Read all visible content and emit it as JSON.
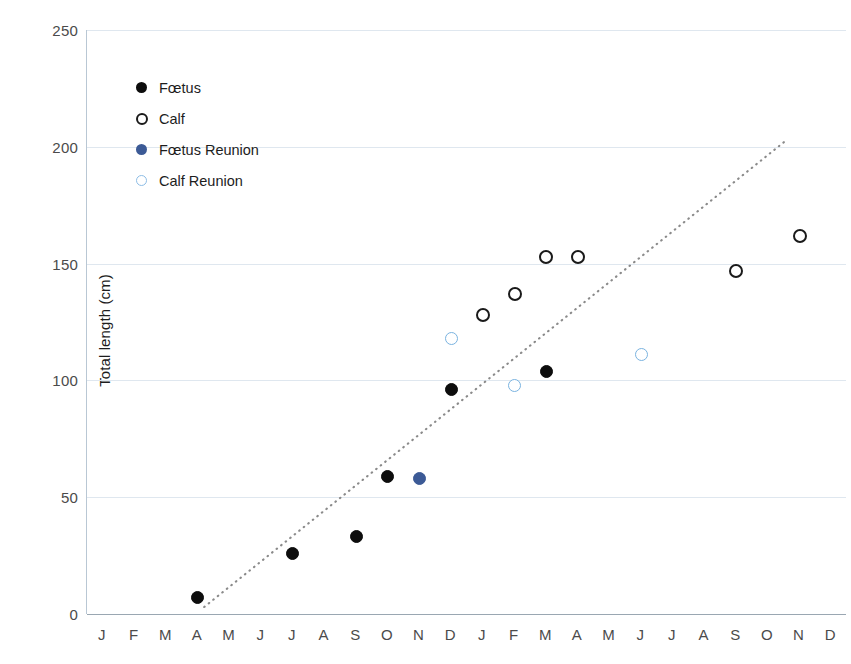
{
  "chart_data": {
    "type": "scatter",
    "title": "",
    "xlabel": "",
    "ylabel": "Total length (cm)",
    "ylim": [
      0,
      250
    ],
    "yticks": [
      0,
      50,
      100,
      150,
      200,
      250
    ],
    "grid": true,
    "legend_position": "upper-left-inside",
    "categories": [
      "J",
      "F",
      "M",
      "A",
      "M",
      "J",
      "J",
      "A",
      "S",
      "O",
      "N",
      "D",
      "J",
      "F",
      "M",
      "A",
      "M",
      "J",
      "J",
      "A",
      "S",
      "O",
      "N",
      "D"
    ],
    "x_axis_note": "Months over two consecutive years (Jan-Dec, Jan-Dec)",
    "series": [
      {
        "name": "Fœtus",
        "marker": "filled-circle",
        "color": "#0d0d0d",
        "points": [
          {
            "x_index": 3,
            "x_label": "A",
            "y": 7
          },
          {
            "x_index": 6,
            "x_label": "J",
            "y": 26
          },
          {
            "x_index": 8,
            "x_label": "S",
            "y": 33
          },
          {
            "x_index": 9,
            "x_label": "O",
            "y": 59
          },
          {
            "x_index": 11,
            "x_label": "D",
            "y": 96
          },
          {
            "x_index": 14,
            "x_label": "M",
            "y": 104
          }
        ]
      },
      {
        "name": "Calf",
        "marker": "open-circle",
        "color": "#1a1a1a",
        "points": [
          {
            "x_index": 12,
            "x_label": "J",
            "y": 128
          },
          {
            "x_index": 13,
            "x_label": "F",
            "y": 137
          },
          {
            "x_index": 14,
            "x_label": "M",
            "y": 153
          },
          {
            "x_index": 15,
            "x_label": "A",
            "y": 153
          },
          {
            "x_index": 20,
            "x_label": "S",
            "y": 147
          },
          {
            "x_index": 22,
            "x_label": "N",
            "y": 162
          }
        ]
      },
      {
        "name": "Fœtus Reunion",
        "marker": "filled-circle",
        "color": "#3c5a96",
        "points": [
          {
            "x_index": 10,
            "x_label": "N",
            "y": 58
          }
        ]
      },
      {
        "name": "Calf Reunion",
        "marker": "open-circle",
        "color": "#7ab3e0",
        "points": [
          {
            "x_index": 11,
            "x_label": "D",
            "y": 118
          },
          {
            "x_index": 13,
            "x_label": "F",
            "y": 98
          },
          {
            "x_index": 17,
            "x_label": "J",
            "y": 111
          }
        ]
      }
    ],
    "trendline": {
      "type": "dotted-linear",
      "color": "#8a8a8a",
      "start": {
        "x_index": 3.2,
        "y": 3
      },
      "end": {
        "x_index": 21.6,
        "y": 203
      }
    }
  },
  "axes": {
    "y_title": "Total length (cm)",
    "y_ticks": [
      "0",
      "50",
      "100",
      "150",
      "200",
      "250"
    ],
    "x_ticks": [
      "J",
      "F",
      "M",
      "A",
      "M",
      "J",
      "J",
      "A",
      "S",
      "O",
      "N",
      "D",
      "J",
      "F",
      "M",
      "A",
      "M",
      "J",
      "J",
      "A",
      "S",
      "O",
      "N",
      "D"
    ]
  },
  "legend": {
    "items": [
      {
        "label": "Fœtus",
        "style": "fetus"
      },
      {
        "label": "Calf",
        "style": "calf"
      },
      {
        "label": "Fœtus Reunion",
        "style": "fetus-reunion"
      },
      {
        "label": "Calf Reunion",
        "style": "calf-reunion"
      }
    ]
  }
}
